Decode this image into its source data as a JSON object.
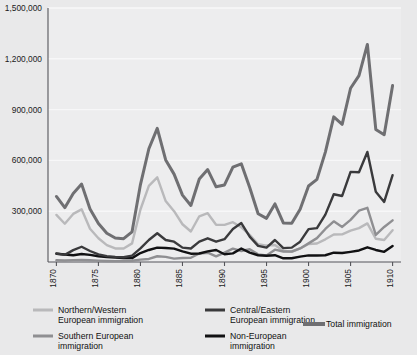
{
  "chart_data": {
    "type": "line",
    "title": "",
    "subtitle": "",
    "xlabel": "",
    "ylabel": "",
    "grid": true,
    "legend_position": "bottom",
    "xlim": [
      1869,
      1911
    ],
    "ylim": [
      0,
      1500000
    ],
    "yticks": [
      300000,
      600000,
      900000,
      1200000,
      1500000
    ],
    "ytick_labels": [
      "300,000",
      "600,000",
      "900,000",
      "1,200,000",
      "1,500,000"
    ],
    "xticks": [
      1870,
      1875,
      1880,
      1885,
      1890,
      1895,
      1900,
      1905,
      1910
    ],
    "xtick_labels": [
      "1870",
      "1875",
      "1880",
      "1885",
      "1890",
      "1895",
      "1900",
      "1905",
      "1910"
    ],
    "x": [
      1870,
      1871,
      1872,
      1873,
      1874,
      1875,
      1876,
      1877,
      1878,
      1879,
      1880,
      1881,
      1882,
      1883,
      1884,
      1885,
      1886,
      1887,
      1888,
      1889,
      1890,
      1891,
      1892,
      1893,
      1894,
      1895,
      1896,
      1897,
      1898,
      1899,
      1900,
      1901,
      1902,
      1903,
      1904,
      1905,
      1906,
      1907,
      1908,
      1909,
      1910
    ],
    "series": [
      {
        "name": "Total immigration",
        "color": "#6f6f72",
        "width": 3.0,
        "values": [
          387000,
          321000,
          405000,
          460000,
          313000,
          227000,
          170000,
          142000,
          138000,
          178000,
          457000,
          669000,
          789000,
          603000,
          519000,
          395000,
          334000,
          490000,
          546000,
          444000,
          455000,
          560000,
          580000,
          440000,
          285000,
          258000,
          343000,
          231000,
          229000,
          312000,
          449000,
          488000,
          649000,
          857000,
          813000,
          1026000,
          1101000,
          1285000,
          783000,
          752000,
          1042000
        ]
      },
      {
        "name": "Northern/Western European immigration",
        "color": "#b9b9bb",
        "width": 2.4,
        "values": [
          278000,
          226000,
          284000,
          311000,
          196000,
          140000,
          100000,
          80000,
          80000,
          110000,
          310000,
          450000,
          500000,
          360000,
          300000,
          223000,
          180000,
          270000,
          288000,
          220000,
          219000,
          235000,
          205000,
          160000,
          105000,
          97000,
          100000,
          65000,
          60000,
          80000,
          106000,
          109000,
          134000,
          162000,
          163000,
          185000,
          200000,
          228000,
          137000,
          130000,
          188000
        ]
      },
      {
        "name": "Southern European immigration",
        "color": "#8f8f92",
        "width": 2.4,
        "values": [
          10000,
          9000,
          11000,
          12000,
          10000,
          8000,
          6000,
          5000,
          6000,
          7000,
          14000,
          18000,
          34000,
          30000,
          20000,
          24000,
          25000,
          50000,
          55000,
          33000,
          55000,
          79000,
          65000,
          75000,
          45000,
          39000,
          73000,
          62000,
          62000,
          80000,
          110000,
          141000,
          195000,
          240000,
          207000,
          249000,
          303000,
          320000,
          160000,
          207000,
          246000
        ]
      },
      {
        "name": "Central/Eastern European immigration",
        "color": "#3a3a3c",
        "width": 2.4,
        "values": [
          50000,
          42000,
          70000,
          90000,
          65000,
          45000,
          35000,
          30000,
          28000,
          38000,
          80000,
          130000,
          170000,
          130000,
          120000,
          85000,
          80000,
          120000,
          140000,
          120000,
          135000,
          195000,
          230000,
          150000,
          95000,
          85000,
          130000,
          82000,
          85000,
          120000,
          194000,
          200000,
          280000,
          400000,
          390000,
          532000,
          530000,
          650000,
          415000,
          355000,
          513000
        ]
      },
      {
        "name": "Non-European immigration",
        "color": "#111113",
        "width": 2.4,
        "values": [
          49000,
          44000,
          40000,
          47000,
          42000,
          34000,
          29000,
          27000,
          24000,
          23000,
          53000,
          71000,
          85000,
          83000,
          79000,
          63000,
          49000,
          50000,
          63000,
          71000,
          46000,
          51000,
          80000,
          55000,
          40000,
          37000,
          40000,
          22000,
          22000,
          32000,
          39000,
          38000,
          40000,
          55000,
          53000,
          60000,
          68000,
          87000,
          71000,
          60000,
          95000
        ]
      }
    ],
    "legend": [
      {
        "label": "Northern/Western European immigration",
        "color": "#b9b9bb"
      },
      {
        "label": "Central/Eastern European immigration",
        "color": "#3a3a3c"
      },
      {
        "label": "Southern European immigration",
        "color": "#8f8f92"
      },
      {
        "label": "Non-European immigration",
        "color": "#111113"
      },
      {
        "label": "Total immigration",
        "color": "#6f6f72"
      }
    ]
  },
  "style": {
    "background": "#e9e9ea",
    "plot_background": "#ededee",
    "grid_color": "#f7f7f8",
    "axis_color": "#55555a"
  }
}
